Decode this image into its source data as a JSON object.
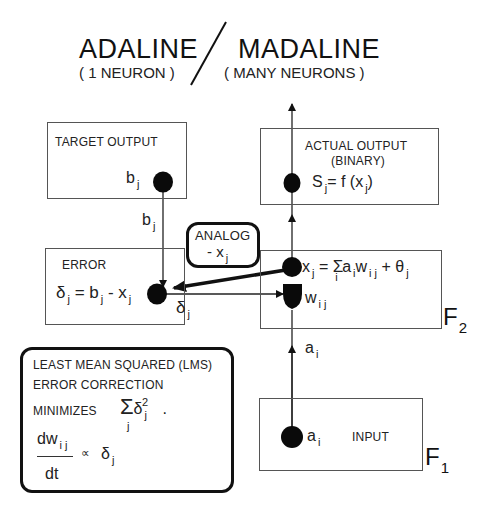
{
  "header": {
    "left_title": "ADALINE",
    "left_subtitle": "( 1 NEURON )",
    "right_title": "MADALINE",
    "right_subtitle": "( MANY NEURONS )"
  },
  "target_box": {
    "label": "TARGET OUTPUT",
    "node_var": "b",
    "node_sub": "j"
  },
  "target_link": {
    "var": "b",
    "sub": "j"
  },
  "actual_box": {
    "label_line1": "ACTUAL OUTPUT",
    "label_line2": "(BINARY)",
    "eq_s": "S",
    "eq_s_sub": "j",
    "eq_rhs": "= f (x",
    "eq_rhs_sub": "j",
    "eq_close": ")"
  },
  "analog_box": {
    "line1": "ANALOG",
    "line2": "- x",
    "line2_sub": "j"
  },
  "error_box": {
    "label": "ERROR",
    "delta": "δ",
    "delta_sub": "j",
    "eq1": "= b",
    "eq1_sub": "j",
    "eq2": "- x",
    "eq2_sub": "j"
  },
  "delta_link": {
    "var": "δ",
    "sub": "j"
  },
  "f2_box": {
    "eq_x": "x",
    "eq_x_sub": "j",
    "eq_eq": "= ",
    "eq_sigma": "Σ",
    "eq_sigma_sub": "i",
    "eq_a": "a",
    "eq_a_sub": "i",
    "eq_w": "w",
    "eq_w_sub": "i j",
    "eq_plus": "+ θ",
    "eq_plus_sub": "j",
    "weight_var": "w",
    "weight_sub": "i j",
    "layer_label": "F",
    "layer_sub": "2"
  },
  "input_link": {
    "var": "a",
    "sub": "i"
  },
  "input_box": {
    "node_var": "a",
    "node_sub": "i",
    "label": "INPUT",
    "layer_label": "F",
    "layer_sub": "1"
  },
  "lms_box": {
    "line1": "LEAST MEAN SQUARED  (LMS)",
    "line2": "ERROR  CORRECTION",
    "line3": "MINIMIZES",
    "sum_sigma": "Σ",
    "sum_sub": "j",
    "sum_delta": "δ",
    "sum_delta_sub": "j",
    "sum_sup": "2",
    "sum_dot": ".",
    "frac_num": "dw",
    "frac_num_sub": "i j",
    "frac_den": "dt",
    "prop": "∝",
    "prop_delta": "δ",
    "prop_delta_sub": "j"
  },
  "colors": {
    "ink": "#111111",
    "box_border": "#555555",
    "background": "#ffffff"
  }
}
